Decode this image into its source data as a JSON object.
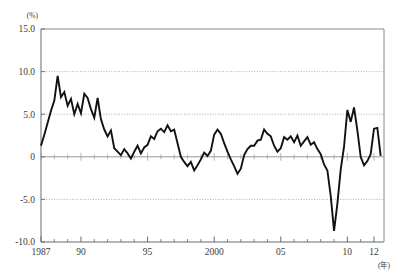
{
  "figure": {
    "unit_label": "(%)",
    "xaxis_unit_label": "(年)",
    "caption": ""
  },
  "chart_data": {
    "type": "line",
    "title": "",
    "subtitle": "",
    "xlabel": "(年)",
    "ylabel": "(%)",
    "grid": true,
    "legend": null,
    "xlim": [
      1987.0,
      2012.75
    ],
    "ylim": [
      -10.0,
      15.0
    ],
    "ytick_labels": [
      "15.0",
      "10.0",
      "5.0",
      "0",
      "-5.0",
      "-10.0"
    ],
    "ytick_values": [
      15.0,
      10.0,
      5.0,
      0,
      -5.0,
      -10.0
    ],
    "xtick_labels": [
      "1987",
      "90",
      "95",
      "2000",
      "05",
      "10",
      "12"
    ],
    "xtick_values": [
      1987,
      1990,
      1995,
      2000,
      2005,
      2010,
      2012
    ],
    "minor_xtick_interval": 1,
    "series": [
      {
        "name": "growth-rate",
        "color": "#111111",
        "x": [
          1987.0,
          1987.25,
          1987.5,
          1987.75,
          1988.0,
          1988.25,
          1988.5,
          1988.75,
          1989.0,
          1989.25,
          1989.5,
          1989.75,
          1990.0,
          1990.25,
          1990.5,
          1990.75,
          1991.0,
          1991.25,
          1991.5,
          1991.75,
          1992.0,
          1992.25,
          1992.5,
          1992.75,
          1993.0,
          1993.25,
          1993.5,
          1993.75,
          1994.0,
          1994.25,
          1994.5,
          1994.75,
          1995.0,
          1995.25,
          1995.5,
          1995.75,
          1996.0,
          1996.25,
          1996.5,
          1996.75,
          1997.0,
          1997.25,
          1997.5,
          1997.75,
          1998.0,
          1998.25,
          1998.5,
          1998.75,
          1999.0,
          1999.25,
          1999.5,
          1999.75,
          2000.0,
          2000.25,
          2000.5,
          2000.75,
          2001.0,
          2001.25,
          2001.5,
          2001.75,
          2002.0,
          2002.25,
          2002.5,
          2002.75,
          2003.0,
          2003.25,
          2003.5,
          2003.75,
          2004.0,
          2004.25,
          2004.5,
          2004.75,
          2005.0,
          2005.25,
          2005.5,
          2005.75,
          2006.0,
          2006.25,
          2006.5,
          2006.75,
          2007.0,
          2007.25,
          2007.5,
          2007.75,
          2008.0,
          2008.25,
          2008.5,
          2008.75,
          2009.0,
          2009.25,
          2009.5,
          2009.75,
          2010.0,
          2010.25,
          2010.5,
          2010.75,
          2011.0,
          2011.25,
          2011.5,
          2011.75,
          2012.0,
          2012.25,
          2012.5
        ],
        "y": [
          1.3,
          2.6,
          4.0,
          5.4,
          6.6,
          9.5,
          7.0,
          7.6,
          6.0,
          6.8,
          5.0,
          6.2,
          5.1,
          7.4,
          6.9,
          5.6,
          4.6,
          6.9,
          4.4,
          3.2,
          2.4,
          3.1,
          1.0,
          0.6,
          0.2,
          0.9,
          0.4,
          -0.2,
          0.6,
          1.3,
          0.4,
          1.1,
          1.4,
          2.4,
          2.1,
          3.0,
          3.3,
          2.9,
          3.7,
          3.0,
          3.2,
          1.6,
          0.0,
          -0.6,
          -1.1,
          -0.6,
          -1.6,
          -1.0,
          -0.3,
          0.5,
          0.1,
          0.7,
          2.6,
          3.2,
          2.7,
          1.6,
          0.6,
          -0.3,
          -1.1,
          -2.0,
          -1.4,
          0.2,
          0.9,
          1.3,
          1.3,
          1.9,
          2.0,
          3.2,
          2.7,
          2.4,
          1.3,
          0.6,
          1.0,
          2.3,
          2.0,
          2.4,
          1.7,
          2.5,
          1.3,
          1.8,
          2.3,
          1.4,
          1.7,
          0.9,
          0.3,
          -0.9,
          -1.6,
          -4.6,
          -8.7,
          -5.5,
          -1.5,
          1.2,
          5.5,
          4.1,
          5.8,
          3.1,
          0.0,
          -1.0,
          -0.5,
          0.3,
          3.3,
          3.4,
          0.1
        ]
      }
    ]
  }
}
